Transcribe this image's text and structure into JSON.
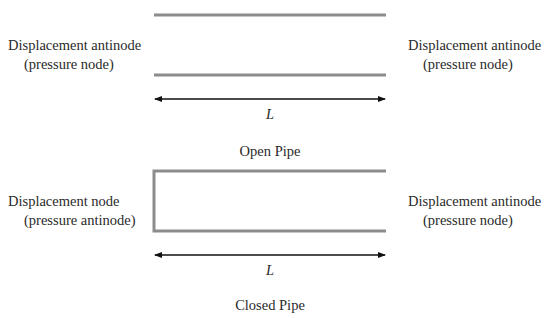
{
  "open_pipe": {
    "title": "Open Pipe",
    "length_label": "L",
    "left_end": {
      "line1": "Displacement antinode",
      "line2": "(pressure node)"
    },
    "right_end": {
      "line1": "Displacement antinode",
      "line2": "(pressure node)"
    }
  },
  "closed_pipe": {
    "title": "Closed Pipe",
    "length_label": "L",
    "left_end": {
      "line1": "Displacement node",
      "line2": "(pressure antinode)"
    },
    "right_end": {
      "line1": "Displacement antinode",
      "line2": "(pressure node)"
    }
  },
  "colors": {
    "pipe_wall": "#8c8c8c",
    "arrow": "#111111",
    "text": "#2a2a2a"
  }
}
